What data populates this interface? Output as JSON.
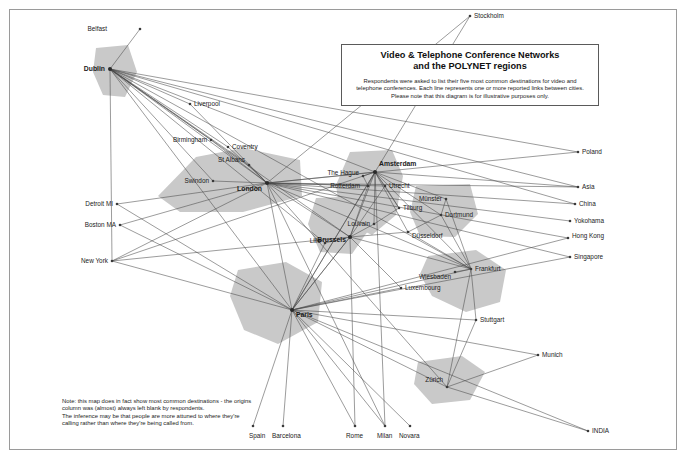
{
  "title_box": {
    "heading_line1": "Video & Telephone Conference Networks",
    "heading_line2": "and the POLYNET regions",
    "body": "Respondents were asked to list their five most common destinations for video and telephone conferences. Each line represents one or more reported links between cities. Please note that this diagram is for illustrative purposes only."
  },
  "note": "Note: this map does in fact show most common destinations - the origins column was (almost) always left blank by respondents.\nThe inference may be that people are more attuned to where they're calling rather than where they're being called from.",
  "colors": {
    "region_fill": "#c9c9c9",
    "link": "#4a4a4a",
    "node": "#3a3a3a",
    "frame": "#9a9a9a",
    "background": "#ffffff"
  },
  "chart_data": {
    "type": "diagram",
    "title": "Video & Telephone Conference Networks and the POLYNET regions",
    "nodes": [
      {
        "id": "belfast",
        "label": "Belfast",
        "x": 140,
        "y": 29,
        "lx": 107,
        "ly": 31,
        "anchor": "end",
        "hub": false
      },
      {
        "id": "dublin",
        "label": "Dublin",
        "x": 110,
        "y": 69,
        "lx": 105,
        "ly": 71,
        "anchor": "end",
        "hub": true
      },
      {
        "id": "liverpool",
        "label": "Liverpool",
        "x": 190,
        "y": 104,
        "lx": 194,
        "ly": 106,
        "anchor": "start",
        "hub": false
      },
      {
        "id": "birmingham",
        "label": "Birmingham",
        "x": 211,
        "y": 140,
        "lx": 207,
        "ly": 142,
        "anchor": "end",
        "hub": false
      },
      {
        "id": "coventry",
        "label": "Coventry",
        "x": 228,
        "y": 147,
        "lx": 232,
        "ly": 149,
        "anchor": "start",
        "hub": false
      },
      {
        "id": "stalbans",
        "label": "St Albans",
        "x": 249,
        "y": 165,
        "lx": 245,
        "ly": 162,
        "anchor": "end",
        "hub": false
      },
      {
        "id": "swindon",
        "label": "Swindon",
        "x": 213,
        "y": 181,
        "lx": 209,
        "ly": 183,
        "anchor": "end",
        "hub": false
      },
      {
        "id": "london",
        "label": "London",
        "x": 267,
        "y": 183,
        "lx": 262,
        "ly": 191,
        "anchor": "end",
        "hub": true
      },
      {
        "id": "stockholm",
        "label": "Stockholm",
        "x": 470,
        "y": 16,
        "lx": 474,
        "ly": 18,
        "anchor": "start",
        "hub": false
      },
      {
        "id": "poland",
        "label": "Poland",
        "x": 578,
        "y": 152,
        "lx": 582,
        "ly": 154,
        "anchor": "start",
        "hub": false
      },
      {
        "id": "asia",
        "label": "Asia",
        "x": 578,
        "y": 187,
        "lx": 582,
        "ly": 189,
        "anchor": "start",
        "hub": false
      },
      {
        "id": "china",
        "label": "China",
        "x": 575,
        "y": 204,
        "lx": 579,
        "ly": 206,
        "anchor": "start",
        "hub": false
      },
      {
        "id": "yokohama",
        "label": "Yokohama",
        "x": 570,
        "y": 221,
        "lx": 574,
        "ly": 223,
        "anchor": "start",
        "hub": false
      },
      {
        "id": "hongkong",
        "label": "Hong Kong",
        "x": 568,
        "y": 238,
        "lx": 572,
        "ly": 238,
        "anchor": "start",
        "hub": false
      },
      {
        "id": "singapore",
        "label": "Singapore",
        "x": 570,
        "y": 257,
        "lx": 574,
        "ly": 259,
        "anchor": "start",
        "hub": false
      },
      {
        "id": "detroit",
        "label": "Detroit MI",
        "x": 117,
        "y": 204,
        "lx": 113,
        "ly": 206,
        "anchor": "end",
        "hub": false
      },
      {
        "id": "boston",
        "label": "Boston MA",
        "x": 120,
        "y": 225,
        "lx": 116,
        "ly": 227,
        "anchor": "end",
        "hub": false
      },
      {
        "id": "newyork",
        "label": "New York",
        "x": 112,
        "y": 261,
        "lx": 108,
        "ly": 263,
        "anchor": "end",
        "hub": false
      },
      {
        "id": "thehague",
        "label": "The Hague",
        "x": 363,
        "y": 176,
        "lx": 359,
        "ly": 175,
        "anchor": "end",
        "hub": false
      },
      {
        "id": "amsterdam",
        "label": "Amsterdam",
        "x": 375,
        "y": 172,
        "lx": 379,
        "ly": 166,
        "anchor": "start",
        "hub": true
      },
      {
        "id": "rotterdam",
        "label": "Rotterdam",
        "x": 368,
        "y": 186,
        "lx": 360,
        "ly": 188,
        "anchor": "end",
        "hub": false
      },
      {
        "id": "utrecht",
        "label": "Utrecht",
        "x": 385,
        "y": 186,
        "lx": 389,
        "ly": 188,
        "anchor": "start",
        "hub": false
      },
      {
        "id": "tilburg",
        "label": "Tilburg",
        "x": 399,
        "y": 208,
        "lx": 403,
        "ly": 210,
        "anchor": "start",
        "hub": false
      },
      {
        "id": "munster",
        "label": "Münster",
        "x": 446,
        "y": 199,
        "lx": 442,
        "ly": 201,
        "anchor": "end",
        "hub": false
      },
      {
        "id": "dortmund",
        "label": "Dortmund",
        "x": 441,
        "y": 215,
        "lx": 445,
        "ly": 217,
        "anchor": "start",
        "hub": false
      },
      {
        "id": "louvain",
        "label": "Louvain",
        "x": 374,
        "y": 224,
        "lx": 370,
        "ly": 226,
        "anchor": "end",
        "hub": false
      },
      {
        "id": "dusseldorf",
        "label": "Düsseldorf",
        "x": 408,
        "y": 232,
        "lx": 412,
        "ly": 238,
        "anchor": "start",
        "hub": false
      },
      {
        "id": "brussels",
        "label": "Brussels",
        "x": 350,
        "y": 237,
        "lx": 346,
        "ly": 242,
        "anchor": "end",
        "hub": true
      },
      {
        "id": "lille",
        "label": "Lille",
        "x": 325,
        "y": 243,
        "lx": 321,
        "ly": 243,
        "anchor": "end",
        "hub": false
      },
      {
        "id": "wiesbaden",
        "label": "Wiesbaden",
        "x": 455,
        "y": 272,
        "lx": 451,
        "ly": 279,
        "anchor": "end",
        "hub": false
      },
      {
        "id": "frankfurt",
        "label": "Frankfurt",
        "x": 471,
        "y": 269,
        "lx": 475,
        "ly": 271,
        "anchor": "start",
        "hub": false
      },
      {
        "id": "luxembourg",
        "label": "Luxembourg",
        "x": 401,
        "y": 288,
        "lx": 405,
        "ly": 290,
        "anchor": "start",
        "hub": false
      },
      {
        "id": "paris",
        "label": "Paris",
        "x": 292,
        "y": 310,
        "lx": 296,
        "ly": 317,
        "anchor": "start",
        "hub": true
      },
      {
        "id": "stuttgart",
        "label": "Stuttgart",
        "x": 476,
        "y": 320,
        "lx": 480,
        "ly": 322,
        "anchor": "start",
        "hub": false
      },
      {
        "id": "munich",
        "label": "Munich",
        "x": 538,
        "y": 355,
        "lx": 542,
        "ly": 357,
        "anchor": "start",
        "hub": false
      },
      {
        "id": "zurich",
        "label": "Zürich",
        "x": 447,
        "y": 387,
        "lx": 443,
        "ly": 382,
        "anchor": "end",
        "hub": false
      },
      {
        "id": "india",
        "label": "INDIA",
        "x": 588,
        "y": 431,
        "lx": 592,
        "ly": 433,
        "anchor": "start",
        "hub": false
      },
      {
        "id": "spain",
        "label": "Spain",
        "x": 253,
        "y": 426,
        "lx": 249,
        "ly": 438,
        "anchor": "start",
        "hub": false
      },
      {
        "id": "barcelona",
        "label": "Barcelona",
        "x": 283,
        "y": 426,
        "lx": 272,
        "ly": 438,
        "anchor": "start",
        "hub": false
      },
      {
        "id": "rome",
        "label": "Rome",
        "x": 355,
        "y": 426,
        "lx": 346,
        "ly": 438,
        "anchor": "start",
        "hub": false
      },
      {
        "id": "milan",
        "label": "Milan",
        "x": 385,
        "y": 426,
        "lx": 377,
        "ly": 438,
        "anchor": "start",
        "hub": false
      },
      {
        "id": "novara",
        "label": "Novara",
        "x": 410,
        "y": 426,
        "lx": 399,
        "ly": 438,
        "anchor": "start",
        "hub": false
      }
    ],
    "links": [
      [
        "dublin",
        "belfast"
      ],
      [
        "dublin",
        "liverpool"
      ],
      [
        "dublin",
        "london"
      ],
      [
        "dublin",
        "stalbans"
      ],
      [
        "dublin",
        "swindon"
      ],
      [
        "dublin",
        "coventry"
      ],
      [
        "dublin",
        "birmingham"
      ],
      [
        "dublin",
        "paris"
      ],
      [
        "dublin",
        "brussels"
      ],
      [
        "dublin",
        "amsterdam"
      ],
      [
        "dublin",
        "frankfurt"
      ],
      [
        "dublin",
        "asia"
      ],
      [
        "dublin",
        "poland"
      ],
      [
        "dublin",
        "china"
      ],
      [
        "dublin",
        "newyork"
      ],
      [
        "dublin",
        "lille"
      ],
      [
        "london",
        "stalbans"
      ],
      [
        "london",
        "swindon"
      ],
      [
        "london",
        "coventry"
      ],
      [
        "london",
        "birmingham"
      ],
      [
        "london",
        "liverpool"
      ],
      [
        "london",
        "paris"
      ],
      [
        "london",
        "brussels"
      ],
      [
        "london",
        "amsterdam"
      ],
      [
        "london",
        "rotterdam"
      ],
      [
        "london",
        "utrecht"
      ],
      [
        "london",
        "frankfurt"
      ],
      [
        "london",
        "newyork"
      ],
      [
        "london",
        "boston"
      ],
      [
        "london",
        "detroit"
      ],
      [
        "london",
        "hongkong"
      ],
      [
        "london",
        "singapore"
      ],
      [
        "london",
        "yokohama"
      ],
      [
        "london",
        "china"
      ],
      [
        "london",
        "asia"
      ],
      [
        "london",
        "poland"
      ],
      [
        "london",
        "stockholm"
      ],
      [
        "london",
        "milan"
      ],
      [
        "london",
        "madrid"
      ],
      [
        "london",
        "zurich"
      ],
      [
        "amsterdam",
        "thehague"
      ],
      [
        "amsterdam",
        "rotterdam"
      ],
      [
        "amsterdam",
        "utrecht"
      ],
      [
        "amsterdam",
        "tilburg"
      ],
      [
        "amsterdam",
        "brussels"
      ],
      [
        "amsterdam",
        "louvain"
      ],
      [
        "amsterdam",
        "dusseldorf"
      ],
      [
        "amsterdam",
        "munster"
      ],
      [
        "amsterdam",
        "dortmund"
      ],
      [
        "amsterdam",
        "frankfurt"
      ],
      [
        "amsterdam",
        "paris"
      ],
      [
        "amsterdam",
        "stockholm"
      ],
      [
        "amsterdam",
        "asia"
      ],
      [
        "amsterdam",
        "newyork"
      ],
      [
        "amsterdam",
        "milan"
      ],
      [
        "brussels",
        "louvain"
      ],
      [
        "brussels",
        "lille"
      ],
      [
        "brussels",
        "paris"
      ],
      [
        "brussels",
        "luxembourg"
      ],
      [
        "brussels",
        "frankfurt"
      ],
      [
        "brussels",
        "rotterdam"
      ],
      [
        "brussels",
        "utrecht"
      ],
      [
        "brussels",
        "dusseldorf"
      ],
      [
        "brussels",
        "newyork"
      ],
      [
        "brussels",
        "rome"
      ],
      [
        "paris",
        "lille"
      ],
      [
        "paris",
        "brussels"
      ],
      [
        "paris",
        "frankfurt"
      ],
      [
        "paris",
        "stuttgart"
      ],
      [
        "paris",
        "zurich"
      ],
      [
        "paris",
        "milan"
      ],
      [
        "paris",
        "novara"
      ],
      [
        "paris",
        "rome"
      ],
      [
        "paris",
        "barcelona"
      ],
      [
        "paris",
        "spain"
      ],
      [
        "paris",
        "newyork"
      ],
      [
        "paris",
        "boston"
      ],
      [
        "paris",
        "detroit"
      ],
      [
        "paris",
        "amsterdam"
      ],
      [
        "paris",
        "munich"
      ],
      [
        "paris",
        "india"
      ],
      [
        "paris",
        "singapore"
      ],
      [
        "paris",
        "hongkong"
      ],
      [
        "paris",
        "luxembourg"
      ],
      [
        "frankfurt",
        "wiesbaden"
      ],
      [
        "frankfurt",
        "dusseldorf"
      ],
      [
        "frankfurt",
        "dortmund"
      ],
      [
        "frankfurt",
        "munster"
      ],
      [
        "frankfurt",
        "stuttgart"
      ],
      [
        "frankfurt",
        "zurich"
      ],
      [
        "zurich",
        "munich"
      ],
      [
        "zurich",
        "india"
      ],
      [
        "zurich",
        "stuttgart"
      ],
      [
        "munster",
        "dortmund"
      ],
      [
        "dusseldorf",
        "dortmund"
      ],
      [
        "tilburg",
        "utrecht"
      ],
      [
        "louvain",
        "tilburg"
      ],
      [
        "thehague",
        "rotterdam"
      ]
    ],
    "regions": [
      {
        "id": "dublin-region",
        "points": "96,48 128,45 137,72 125,97 103,95 93,72"
      },
      {
        "id": "london-region",
        "points": "158,196 196,157 243,148 300,160 302,196 243,212 180,212"
      },
      {
        "id": "randstad-region",
        "points": "350,152 392,150 403,176 396,215 372,235 341,220 336,185"
      },
      {
        "id": "rhineruhr-region",
        "points": "416,186 470,184 478,214 455,237 420,236 410,212"
      },
      {
        "id": "belgium-region",
        "points": "316,198 362,196 370,228 352,254 320,252 308,224"
      },
      {
        "id": "paris-region",
        "points": "238,270 286,262 322,282 318,322 278,344 244,330 230,296"
      },
      {
        "id": "frankfurt-region",
        "points": "428,256 476,250 506,270 500,302 466,312 432,296 420,274"
      },
      {
        "id": "zurich-region",
        "points": "418,362 462,356 485,372 470,400 432,404 414,384"
      }
    ]
  }
}
